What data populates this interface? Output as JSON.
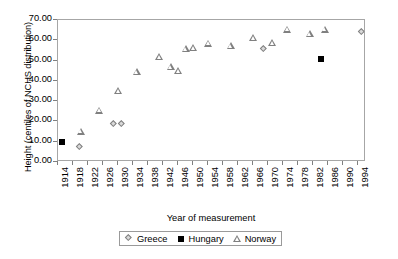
{
  "chart_data": {
    "type": "scatter",
    "title": "",
    "xlabel": "Year of measurement",
    "ylabel": "Height (centiles of NCHS distribution)",
    "xlim": [
      1914,
      1996
    ],
    "ylim": [
      0,
      70
    ],
    "ytick_labels": [
      "70.00",
      "60.00",
      "50.00",
      "40.00",
      "30.00",
      "20.00",
      "10.00",
      "0.00"
    ],
    "ytick_values": [
      70,
      60,
      50,
      40,
      30,
      20,
      10,
      0
    ],
    "xtick_labels": [
      "1914",
      "1918",
      "1922",
      "1926",
      "1930",
      "1934",
      "1938",
      "1942",
      "1946",
      "1950",
      "1954",
      "1958",
      "1962",
      "1966",
      "1970",
      "1974",
      "1978",
      "1982",
      "1986",
      "1990",
      "1994"
    ],
    "xtick_values": [
      1914,
      1918,
      1922,
      1926,
      1930,
      1934,
      1938,
      1942,
      1946,
      1950,
      1954,
      1958,
      1962,
      1966,
      1970,
      1974,
      1978,
      1982,
      1986,
      1990,
      1994
    ],
    "grid": false,
    "legend_position": "below-axis-center",
    "series": [
      {
        "name": "Greece",
        "marker": "diamond",
        "points": [
          {
            "x": 1920,
            "y": 7.3
          },
          {
            "x": 1929,
            "y": 18.7
          },
          {
            "x": 1931,
            "y": 18.7
          },
          {
            "x": 1969,
            "y": 55.7
          },
          {
            "x": 1995,
            "y": 64.0
          }
        ]
      },
      {
        "name": "Hungary",
        "marker": "filled-square",
        "points": [
          {
            "x": 1915,
            "y": 10.0
          },
          {
            "x": 1984,
            "y": 51.0
          }
        ]
      },
      {
        "name": "Norway",
        "marker": "open-triangle",
        "points": [
          {
            "x": 1920,
            "y": 15.2
          },
          {
            "x": 1925,
            "y": 25.5
          },
          {
            "x": 1930,
            "y": 35.2
          },
          {
            "x": 1935,
            "y": 44.4
          },
          {
            "x": 1941,
            "y": 52.1
          },
          {
            "x": 1944,
            "y": 46.8
          },
          {
            "x": 1946,
            "y": 45.2
          },
          {
            "x": 1948,
            "y": 55.7
          },
          {
            "x": 1950,
            "y": 56.2
          },
          {
            "x": 1954,
            "y": 58.6
          },
          {
            "x": 1960,
            "y": 57.3
          },
          {
            "x": 1966,
            "y": 61.2
          },
          {
            "x": 1971,
            "y": 58.8
          },
          {
            "x": 1975,
            "y": 65.5
          },
          {
            "x": 1981,
            "y": 63.3
          },
          {
            "x": 1985,
            "y": 65.5
          }
        ]
      }
    ]
  },
  "legend": {
    "entries": [
      {
        "label": "Greece"
      },
      {
        "label": "Hungary"
      },
      {
        "label": "Norway"
      }
    ]
  },
  "bottom_caption": "",
  "colors": {
    "axis": "#a6a6a6",
    "tick": "#808080",
    "marker_outline": "#808080",
    "marker_fill_greece": "#d9d9d9",
    "marker_fill_hungary": "#000000",
    "text": "#000000",
    "background": "#ffffff"
  }
}
